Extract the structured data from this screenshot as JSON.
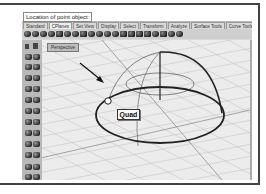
{
  "command_line": {
    "prompt": "Location of point object:"
  },
  "tabs": [
    {
      "label": "Standard"
    },
    {
      "label": "CPlanes"
    },
    {
      "label": "Set View"
    },
    {
      "label": "Display"
    },
    {
      "label": "Select"
    },
    {
      "label": "Transform"
    },
    {
      "label": "Analyze"
    },
    {
      "label": "Surface Tools"
    },
    {
      "label": "Curve Tools"
    }
  ],
  "active_tab_index": 1,
  "toolbar_icons": [
    "new-icon",
    "open-icon",
    "save-icon",
    "print-icon",
    "cut-icon",
    "copy-icon",
    "paste-icon",
    "undo-icon",
    "redo-icon",
    "pan-icon",
    "rotate-view-icon",
    "zoom-icon",
    "zoom-extents-icon",
    "zoom-window-icon",
    "zoom-selected-icon",
    "set-cplane-icon",
    "layer-icon",
    "properties-icon",
    "render-icon",
    "options-icon"
  ],
  "left_toolbar_icons": [
    "select-icon",
    "point-icon",
    "polyline-icon",
    "curve-icon",
    "circle-icon",
    "arc-icon",
    "box-icon",
    "sphere-icon",
    "cylinder-icon",
    "cone-icon",
    "torus-icon",
    "extrude-icon",
    "loft-icon",
    "revolve-icon",
    "boolean-icon",
    "fillet-icon",
    "join-icon",
    "explode-icon",
    "trim-icon",
    "split-icon",
    "move-icon",
    "copy-icon"
  ],
  "viewport": {
    "label": "Perspective",
    "snap_tooltip": "Quad"
  },
  "colors": {
    "frame": "#444444",
    "viewport_bg": "#ececec",
    "grid": "#c4c4c4",
    "curve": "#2a2a2a"
  }
}
